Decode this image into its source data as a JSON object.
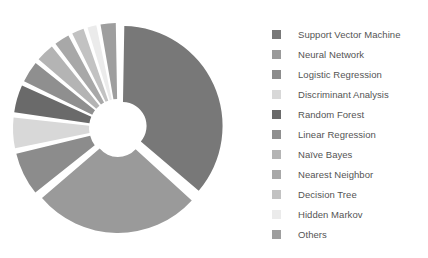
{
  "chart_data": {
    "type": "pie",
    "variant": "exploded-donut",
    "title": "",
    "subtitle": "",
    "xlabel": "",
    "ylabel": "",
    "grid": false,
    "legend_position": "right",
    "start_angle_deg": 0,
    "direction": "clockwise",
    "inner_radius_ratio": 0.24,
    "explode_gap_deg": 2.0,
    "categories": [
      "Support Vector Machine",
      "Neural Network",
      "Logistic Regression",
      "Discriminant Analysis",
      "Random Forest",
      "Linear Regression",
      "Naïve Bayes",
      "Nearest Neighbor",
      "Decision Tree",
      "Hidden Markov",
      "Others"
    ],
    "values": [
      36.5,
      27.5,
      7.5,
      5.5,
      5.0,
      4.0,
      3.5,
      3.0,
      2.5,
      2.0,
      3.0
    ],
    "colors": [
      "#787878",
      "#9a9a9a",
      "#8c8c8c",
      "#d8d8d8",
      "#6a6a6a",
      "#8f8f8f",
      "#b4b4b4",
      "#a8a8a8",
      "#c2c2c2",
      "#ebebeb",
      "#9e9e9e"
    ]
  },
  "legend": {
    "items": [
      {
        "label": "Support Vector Machine",
        "color": "#787878"
      },
      {
        "label": "Neural Network",
        "color": "#9a9a9a"
      },
      {
        "label": "Logistic Regression",
        "color": "#8c8c8c"
      },
      {
        "label": "Discriminant Analysis",
        "color": "#d8d8d8"
      },
      {
        "label": "Random Forest",
        "color": "#6a6a6a"
      },
      {
        "label": "Linear Regression",
        "color": "#8f8f8f"
      },
      {
        "label": "Naïve Bayes",
        "color": "#b4b4b4"
      },
      {
        "label": "Nearest Neighbor",
        "color": "#a8a8a8"
      },
      {
        "label": "Decision Tree",
        "color": "#c2c2c2"
      },
      {
        "label": "Hidden Markov",
        "color": "#ebebeb"
      },
      {
        "label": "Others",
        "color": "#9e9e9e"
      }
    ]
  },
  "figure": {
    "background": "#ffffff",
    "text_color": "#545454"
  }
}
